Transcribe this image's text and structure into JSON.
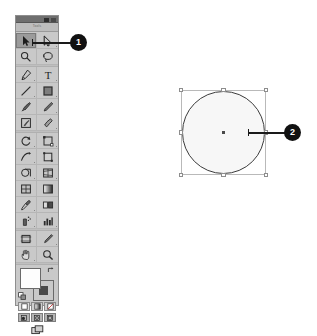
{
  "application": {
    "name": "Adobe Illustrator",
    "scene": "Tools panel with Selection tool active and a selected ellipse on the artboard",
    "background_color": "#ffffff"
  },
  "tools_panel": {
    "tab_label": "Tools",
    "titlebar": {
      "collapse_icon": "double-arrow-collapse-icon",
      "close_icon": "close-icon"
    },
    "groups": [
      {
        "name": "selection-tools",
        "rows": [
          [
            {
              "id": "selection-tool",
              "icon": "selection-arrow-icon",
              "label": "Selection Tool",
              "active": true,
              "has_flyout": false
            },
            {
              "id": "direct-selection-tool",
              "icon": "direct-selection-arrow-icon",
              "label": "Direct Selection Tool",
              "active": false,
              "has_flyout": true
            }
          ],
          [
            {
              "id": "magic-wand-tool",
              "icon": "magic-wand-icon",
              "label": "Magic Wand Tool",
              "active": false,
              "has_flyout": false
            },
            {
              "id": "lasso-tool",
              "icon": "lasso-icon",
              "label": "Lasso Tool",
              "active": false,
              "has_flyout": false
            }
          ]
        ]
      },
      {
        "name": "drawing-tools",
        "rows": [
          [
            {
              "id": "pen-tool",
              "icon": "pen-icon",
              "label": "Pen Tool",
              "active": false,
              "has_flyout": true
            },
            {
              "id": "type-tool",
              "icon": "type-icon",
              "label": "Type Tool",
              "active": false,
              "has_flyout": true
            }
          ],
          [
            {
              "id": "line-segment-tool",
              "icon": "line-segment-icon",
              "label": "Line Segment Tool",
              "active": false,
              "has_flyout": true
            },
            {
              "id": "rectangle-tool",
              "icon": "rectangle-icon",
              "label": "Rectangle Tool",
              "active": false,
              "has_flyout": true
            }
          ],
          [
            {
              "id": "paintbrush-tool",
              "icon": "paintbrush-icon",
              "label": "Paintbrush Tool",
              "active": false,
              "has_flyout": false
            },
            {
              "id": "pencil-tool",
              "icon": "pencil-icon",
              "label": "Pencil Tool",
              "active": false,
              "has_flyout": true
            }
          ],
          [
            {
              "id": "blob-brush-tool",
              "icon": "blob-brush-icon",
              "label": "Blob Brush Tool",
              "active": false,
              "has_flyout": false
            },
            {
              "id": "eraser-tool",
              "icon": "eraser-icon",
              "label": "Eraser Tool",
              "active": false,
              "has_flyout": true
            }
          ]
        ]
      },
      {
        "name": "transform-tools",
        "rows": [
          [
            {
              "id": "rotate-tool",
              "icon": "rotate-icon",
              "label": "Rotate Tool",
              "active": false,
              "has_flyout": true
            },
            {
              "id": "scale-tool",
              "icon": "scale-icon",
              "label": "Scale Tool",
              "active": false,
              "has_flyout": true
            }
          ],
          [
            {
              "id": "width-tool",
              "icon": "width-warp-icon",
              "label": "Width Tool",
              "active": false,
              "has_flyout": true
            },
            {
              "id": "free-transform-tool",
              "icon": "free-transform-icon",
              "label": "Free Transform Tool",
              "active": false,
              "has_flyout": false
            }
          ],
          [
            {
              "id": "shape-builder-tool",
              "icon": "shape-builder-icon",
              "label": "Shape Builder Tool",
              "active": false,
              "has_flyout": true
            },
            {
              "id": "perspective-grid-tool",
              "icon": "perspective-grid-icon",
              "label": "Perspective Grid Tool",
              "active": false,
              "has_flyout": true
            }
          ],
          [
            {
              "id": "mesh-tool",
              "icon": "mesh-icon",
              "label": "Mesh Tool",
              "active": false,
              "has_flyout": false
            },
            {
              "id": "gradient-tool",
              "icon": "gradient-icon",
              "label": "Gradient Tool",
              "active": false,
              "has_flyout": false
            }
          ],
          [
            {
              "id": "eyedropper-tool",
              "icon": "eyedropper-icon",
              "label": "Eyedropper Tool",
              "active": false,
              "has_flyout": true
            },
            {
              "id": "blend-tool",
              "icon": "blend-icon",
              "label": "Blend Tool",
              "active": false,
              "has_flyout": false
            }
          ],
          [
            {
              "id": "symbol-sprayer-tool",
              "icon": "symbol-sprayer-icon",
              "label": "Symbol Sprayer Tool",
              "active": false,
              "has_flyout": true
            },
            {
              "id": "column-graph-tool",
              "icon": "column-graph-icon",
              "label": "Column Graph Tool",
              "active": false,
              "has_flyout": true
            }
          ]
        ]
      },
      {
        "name": "navigation-tools",
        "rows": [
          [
            {
              "id": "artboard-tool",
              "icon": "artboard-icon",
              "label": "Artboard Tool",
              "active": false,
              "has_flyout": false
            },
            {
              "id": "slice-tool",
              "icon": "slice-icon",
              "label": "Slice Tool",
              "active": false,
              "has_flyout": true
            }
          ],
          [
            {
              "id": "hand-tool",
              "icon": "hand-icon",
              "label": "Hand Tool",
              "active": false,
              "has_flyout": true
            },
            {
              "id": "zoom-tool",
              "icon": "magnifier-icon",
              "label": "Zoom Tool",
              "active": false,
              "has_flyout": false
            }
          ]
        ]
      }
    ],
    "fill_stroke": {
      "fill_label": "Fill",
      "fill_color": "#fdfdfd",
      "stroke_label": "Stroke",
      "stroke_color": "#4a4a4a",
      "swap_icon": "swap-fill-stroke-icon",
      "default_icon": "default-fill-stroke-icon"
    },
    "paint_modes": [
      {
        "id": "color-mode",
        "icon": "solid-color-icon",
        "label": "Color",
        "selected": true
      },
      {
        "id": "gradient-mode",
        "icon": "gradient-swatch-icon",
        "label": "Gradient",
        "selected": false
      },
      {
        "id": "none-mode",
        "icon": "none-slash-icon",
        "label": "None",
        "selected": false
      }
    ],
    "drawing_modes": [
      {
        "id": "draw-normal",
        "icon": "draw-normal-icon",
        "label": "Draw Normal",
        "selected": true
      },
      {
        "id": "draw-behind",
        "icon": "draw-behind-icon",
        "label": "Draw Behind",
        "selected": false
      },
      {
        "id": "draw-inside",
        "icon": "draw-inside-icon",
        "label": "Draw Inside",
        "selected": false
      }
    ],
    "screen_mode": {
      "id": "change-screen-mode",
      "icon": "screen-mode-icon",
      "label": "Change Screen Mode"
    }
  },
  "artboard": {
    "object": {
      "type": "ellipse",
      "name": "selected-ellipse",
      "fill_color": "#f7f7f7",
      "stroke_color": "#3b3b3b",
      "selected": true,
      "bounding_box_color": "#b9b9b9",
      "handle_count": 8,
      "center_point": "anchor-center-point"
    }
  },
  "callouts": [
    {
      "id": "callout-1",
      "number": "1",
      "target": "selection-tool"
    },
    {
      "id": "callout-2",
      "number": "2",
      "target": "selected-ellipse"
    }
  ]
}
